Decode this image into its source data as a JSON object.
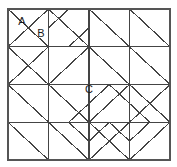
{
  "figure": {
    "kind": "geometric-tiling-diagram",
    "caption_labels": [
      "A",
      "B",
      "C"
    ],
    "background_color": "#ffffff",
    "line_color": "#444444",
    "border_color": "#555555",
    "label_color": "#1a1a1a",
    "border": {
      "x": 8,
      "y": 9,
      "width": 162,
      "height": 151,
      "stroke_width": 1.6
    },
    "grid": {
      "columns": 4,
      "rows": 4,
      "x_lines": [
        8,
        48.5,
        89,
        129.5,
        170
      ],
      "y_lines": [
        9,
        46.75,
        84.5,
        122.25,
        160
      ],
      "stroke_width": 1.2
    },
    "labels": [
      {
        "name": "label-a",
        "text": "A",
        "x": 22,
        "y": 22
      },
      {
        "name": "label-b",
        "text": "B",
        "x": 41,
        "y": 34
      },
      {
        "name": "label-c",
        "text": "C",
        "x": 89,
        "y": 90
      }
    ],
    "segments": [
      {
        "name": "cell-0-0-diagonal-tl-br",
        "x1": 8,
        "y1": 9,
        "x2": 48.5,
        "y2": 46.75
      },
      {
        "name": "cell-0-0-diagonal-bl-tr",
        "x1": 8,
        "y1": 46.75,
        "x2": 48.5,
        "y2": 9
      },
      {
        "name": "cell-1-0-diagonal-tl-br",
        "x1": 48.5,
        "y1": 9,
        "x2": 89,
        "y2": 46.75
      },
      {
        "name": "cell-2-0-diagonal-tl-br",
        "x1": 89,
        "y1": 9,
        "x2": 129.5,
        "y2": 46.75
      },
      {
        "name": "cell-3-0-diagonal-tl-br",
        "x1": 129.5,
        "y1": 9,
        "x2": 170,
        "y2": 46.75
      },
      {
        "name": "cell-1-0-half-diamond-left",
        "x1": 48.5,
        "y1": 27.9,
        "x2": 68.75,
        "y2": 9
      },
      {
        "name": "cell-1-0-half-diamond-right",
        "x1": 68.75,
        "y1": 46.75,
        "x2": 89,
        "y2": 27.9
      },
      {
        "name": "cell-0-1-diagonal-tl-br",
        "x1": 8,
        "y1": 46.75,
        "x2": 48.5,
        "y2": 84.5
      },
      {
        "name": "cell-0-1-diagonal-bl-tr",
        "x1": 8,
        "y1": 84.5,
        "x2": 48.5,
        "y2": 46.75
      },
      {
        "name": "cell-3-1-diagonal-tl-br",
        "x1": 129.5,
        "y1": 46.75,
        "x2": 170,
        "y2": 84.5
      },
      {
        "name": "cell-2-1-diagonal-tl-br",
        "x1": 89,
        "y1": 46.75,
        "x2": 129.5,
        "y2": 84.5
      },
      {
        "name": "diamond-c-edge-top-left",
        "x1": 48.5,
        "y1": 84.5,
        "x2": 89,
        "y2": 46.75
      },
      {
        "name": "diamond-c-edge-top-right",
        "x1": 89,
        "y1": 46.75,
        "x2": 129.5,
        "y2": 84.5
      },
      {
        "name": "diamond-c-edge-bottom-right",
        "x1": 129.5,
        "y1": 84.5,
        "x2": 89,
        "y2": 122.25
      },
      {
        "name": "diamond-c-edge-bottom-left",
        "x1": 89,
        "y1": 122.25,
        "x2": 48.5,
        "y2": 84.5
      },
      {
        "name": "cell-0-2-diagonal-tl-br",
        "x1": 8,
        "y1": 84.5,
        "x2": 48.5,
        "y2": 122.25
      },
      {
        "name": "cell-1-2-diagonal-tl-br",
        "x1": 48.5,
        "y1": 84.5,
        "x2": 89,
        "y2": 122.25
      },
      {
        "name": "cell-0-3-diagonal-tl-br",
        "x1": 8,
        "y1": 122.25,
        "x2": 48.5,
        "y2": 160
      },
      {
        "name": "cell-1-3-diagonal-tl-br",
        "x1": 48.5,
        "y1": 122.25,
        "x2": 89,
        "y2": 160
      },
      {
        "name": "cell-2-2-diagonal-bl-tr",
        "x1": 89,
        "y1": 122.25,
        "x2": 129.5,
        "y2": 84.5
      },
      {
        "name": "cell-3-2-diagonal-tl-br",
        "x1": 129.5,
        "y1": 84.5,
        "x2": 170,
        "y2": 122.25
      },
      {
        "name": "cell-3-2-diagonal-bl-tr",
        "x1": 129.5,
        "y1": 122.25,
        "x2": 170,
        "y2": 84.5
      },
      {
        "name": "cell-2-3-diagonal-tl-br",
        "x1": 89,
        "y1": 122.25,
        "x2": 129.5,
        "y2": 160
      },
      {
        "name": "cell-2-3-diagonal-bl-tr",
        "x1": 89,
        "y1": 160,
        "x2": 129.5,
        "y2": 122.25
      },
      {
        "name": "cell-3-3-diagonal-bl-tr",
        "x1": 129.5,
        "y1": 160,
        "x2": 170,
        "y2": 122.25
      },
      {
        "name": "pinwheel-br-half-left-upper",
        "x1": 109.25,
        "y1": 84.5,
        "x2": 89,
        "y2": 103.4
      },
      {
        "name": "pinwheel-br-half-right-upper",
        "x1": 109.25,
        "y1": 84.5,
        "x2": 129.5,
        "y2": 103.4
      },
      {
        "name": "pinwheel-br-half-left-lower",
        "x1": 89,
        "y1": 141.1,
        "x2": 109.25,
        "y2": 122.25
      },
      {
        "name": "pinwheel-br-half-right-lower",
        "x1": 109.25,
        "y1": 122.25,
        "x2": 129.5,
        "y2": 141.1
      },
      {
        "name": "pinwheel-br-inner-left",
        "x1": 89,
        "y1": 103.4,
        "x2": 68.75,
        "y2": 122.25
      },
      {
        "name": "pinwheel-br-inner-right",
        "x1": 129.5,
        "y1": 103.4,
        "x2": 149.75,
        "y2": 122.25
      },
      {
        "name": "pinwheel-br-inner-left-lower",
        "x1": 68.75,
        "y1": 122.25,
        "x2": 89,
        "y2": 141.1
      },
      {
        "name": "pinwheel-br-inner-right-lower",
        "x1": 149.75,
        "y1": 122.25,
        "x2": 129.5,
        "y2": 141.1
      }
    ]
  }
}
